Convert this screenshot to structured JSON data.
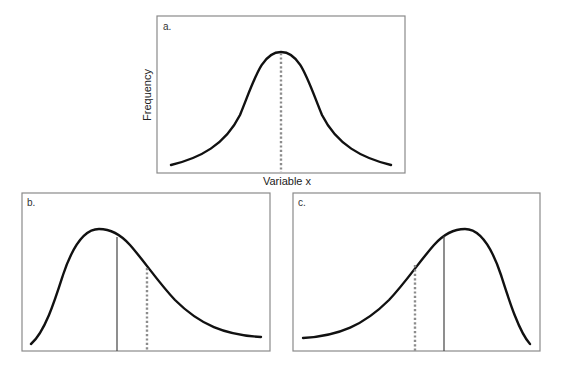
{
  "panels": {
    "a": {
      "label": "a.",
      "xlabel": "Variable x",
      "ylabel": "Frequency",
      "shape": "symmetric normal distribution",
      "markers": [
        "mean/median/mode (dotted, at peak)"
      ]
    },
    "b": {
      "label": "b.",
      "shape": "positively (right) skewed distribution",
      "markers": [
        "solid line right of peak",
        "dotted line further right"
      ]
    },
    "c": {
      "label": "c.",
      "shape": "negatively (left) skewed distribution",
      "markers": [
        "dotted line left",
        "solid line left of peak"
      ]
    }
  },
  "colors": {
    "curve": "#111111",
    "dotted_line": "#8c8c8c",
    "solid_line": "#444444",
    "frame": "#8a8a8a"
  }
}
